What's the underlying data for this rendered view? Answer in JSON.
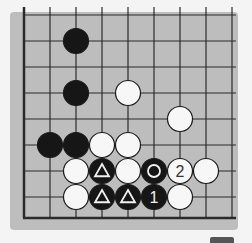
{
  "diagram": {
    "type": "go-board-fragment",
    "grid": {
      "origin_x": 24,
      "origin_y": 15,
      "spacing": 26,
      "cols": 9,
      "rows": 8,
      "bottom_edge_y": 218,
      "left_edge": true,
      "bottom_edge": true,
      "line_color": "#2a2a2a",
      "board_color": "#bdbdbd"
    },
    "stones": [
      {
        "color": "black",
        "col": 2,
        "row": 1,
        "mark": ""
      },
      {
        "color": "black",
        "col": 2,
        "row": 3,
        "mark": ""
      },
      {
        "color": "white",
        "col": 4,
        "row": 3,
        "mark": ""
      },
      {
        "color": "white",
        "col": 6,
        "row": 4,
        "mark": ""
      },
      {
        "color": "black",
        "col": 1,
        "row": 5,
        "mark": ""
      },
      {
        "color": "black",
        "col": 2,
        "row": 5,
        "mark": ""
      },
      {
        "color": "white",
        "col": 3,
        "row": 5,
        "mark": ""
      },
      {
        "color": "white",
        "col": 4,
        "row": 5,
        "mark": ""
      },
      {
        "color": "white",
        "col": 2,
        "row": 6,
        "mark": ""
      },
      {
        "color": "black",
        "col": 3,
        "row": 6,
        "mark": "triangle"
      },
      {
        "color": "white",
        "col": 4,
        "row": 6,
        "mark": ""
      },
      {
        "color": "black",
        "col": 5,
        "row": 6,
        "mark": "circle"
      },
      {
        "color": "white",
        "col": 6,
        "row": 6,
        "mark": "2"
      },
      {
        "color": "white",
        "col": 7,
        "row": 6,
        "mark": ""
      },
      {
        "color": "white",
        "col": 2,
        "row": 7,
        "mark": ""
      },
      {
        "color": "black",
        "col": 3,
        "row": 7,
        "mark": "triangle"
      },
      {
        "color": "black",
        "col": 4,
        "row": 7,
        "mark": "triangle"
      },
      {
        "color": "black",
        "col": 5,
        "row": 7,
        "mark": "1"
      },
      {
        "color": "white",
        "col": 6,
        "row": 7,
        "mark": ""
      }
    ],
    "move_labels": {
      "move_1": "1",
      "move_2": "2"
    }
  }
}
